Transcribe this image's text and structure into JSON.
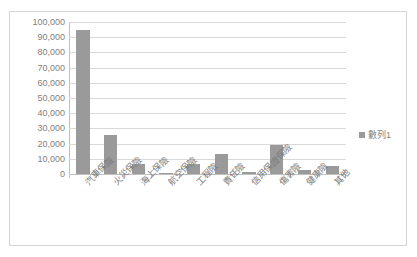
{
  "chart_data": {
    "type": "bar",
    "title": "",
    "subtitle": "",
    "xlabel": "",
    "ylabel": "",
    "grid": true,
    "legend_position": "right",
    "ylim": [
      0,
      100000
    ],
    "ytick_labels": [
      "100,000",
      "90,000",
      "80,000",
      "70,000",
      "60,000",
      "50,000",
      "40,000",
      "30,000",
      "20,000",
      "10,000",
      "0"
    ],
    "ytick_values": [
      100000,
      90000,
      80000,
      70000,
      60000,
      50000,
      40000,
      30000,
      20000,
      10000,
      0
    ],
    "categories": [
      "汽車保險",
      "火災保險",
      "海上保險",
      "航空保險",
      "工程險",
      "責任險",
      "信用保證保險",
      "傷害險",
      "健康險",
      "其他"
    ],
    "values": [
      94500,
      25700,
      6800,
      800,
      6400,
      13400,
      1000,
      19400,
      2800,
      5300
    ],
    "series": [
      {
        "name": "數列1",
        "color": "#9a9a9a",
        "values": [
          94500,
          25700,
          6800,
          800,
          6400,
          13400,
          1000,
          19400,
          2800,
          5300
        ]
      }
    ],
    "legend": [
      "數列1"
    ]
  },
  "legend": {
    "label": "數列1",
    "marker_color": "#9a9a9a"
  },
  "colors": {
    "bar": "#9a9a9a",
    "gridline": "#d9d9d9",
    "axis": "#bfbfbf",
    "tick_text": "#7f7f7f",
    "frame_border": "#d4d4d4",
    "background": "#ffffff"
  }
}
